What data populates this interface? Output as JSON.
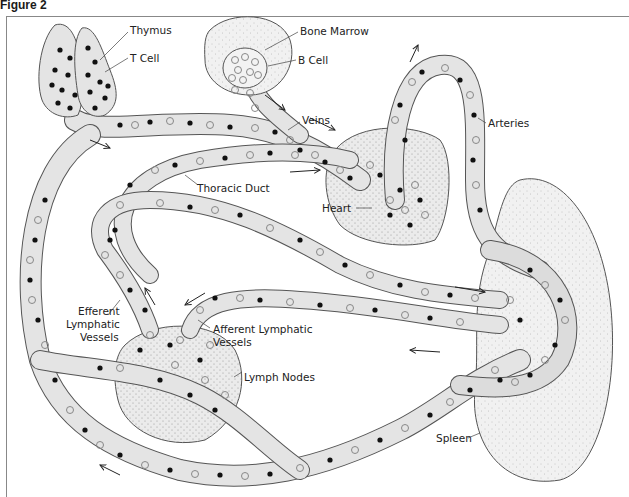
{
  "figure": {
    "title": "Figure 2"
  },
  "diagram": {
    "colors": {
      "vessel_fill": "#e4e4e4",
      "organ_fill": "#e9e9e9",
      "outline": "#555555",
      "t_cell": "#111111",
      "b_cell": "#888888"
    },
    "labels": {
      "thymus": "Thymus",
      "t_cell": "T Cell",
      "bone_marrow": "Bone Marrow",
      "b_cell": "B Cell",
      "veins": "Veins",
      "arteries": "Arteries",
      "thoracic_duct": "Thoracic Duct",
      "heart": "Heart",
      "efferent_1": "Efferent",
      "efferent_2": "Lymphatic",
      "efferent_3": "Vessels",
      "afferent_1": "Afferent Lymphatic",
      "afferent_2": "Vessels",
      "lymph_nodes": "Lymph Nodes",
      "spleen": "Spleen"
    },
    "legend_semantics": {
      "filled_circle": "T Cell",
      "open_circle": "B Cell"
    }
  }
}
